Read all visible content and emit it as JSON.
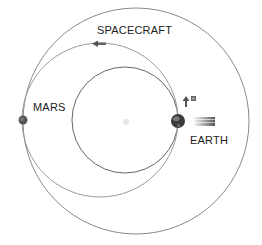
{
  "labels": {
    "spacecraft": "SPACECRAFT",
    "mars": "MARS",
    "earth": "EARTH"
  },
  "colors": {
    "orbit_line": "#8a8a8a",
    "earth": "#3a3a3a",
    "mars": "#555555",
    "sun": "#e6e6e6",
    "text": "#222222"
  },
  "diagram": {
    "mars_orbit": {
      "cx": 136,
      "cy": 121,
      "r": 113
    },
    "earth_orbit": {
      "cx": 125,
      "cy": 120,
      "r": 53
    },
    "transfer_orbit": {
      "cx": 100,
      "cy": 120,
      "rx": 78,
      "ry": 77
    },
    "sun": {
      "cx": 126,
      "cy": 122
    },
    "earth_position": {
      "x": 178,
      "y": 121
    },
    "mars_position": {
      "x": 23,
      "y": 120
    }
  }
}
